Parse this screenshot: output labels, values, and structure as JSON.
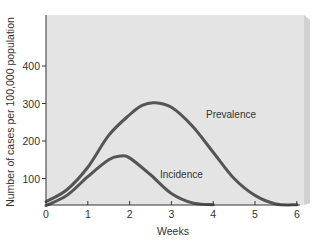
{
  "chart_data": {
    "type": "line",
    "title": "",
    "xlabel": "Weeks",
    "ylabel": "Number of cases per 100,000 population",
    "xlim": [
      0,
      6
    ],
    "ylim": [
      30,
      480
    ],
    "x_ticks": [
      "0",
      "1",
      "2",
      "3",
      "4",
      "5",
      "6"
    ],
    "y_ticks": [
      "100",
      "200",
      "300",
      "400"
    ],
    "grid": false,
    "legend": "inline labels",
    "series": [
      {
        "name": "Prevalence",
        "x": [
          0,
          0.5,
          1,
          1.5,
          2,
          2.3,
          2.6,
          3,
          3.5,
          4,
          4.5,
          5,
          5.5,
          6
        ],
        "values": [
          38,
          70,
          130,
          215,
          270,
          295,
          302,
          290,
          240,
          170,
          100,
          55,
          32,
          30
        ]
      },
      {
        "name": "Incidence",
        "x": [
          0,
          0.5,
          1,
          1.5,
          1.8,
          2,
          2.5,
          3,
          3.5,
          4
        ],
        "values": [
          28,
          55,
          105,
          150,
          160,
          155,
          110,
          60,
          35,
          30
        ]
      }
    ]
  },
  "labels": {
    "xlabel": "Weeks",
    "ylabel": "Number of cases per 100,000 population",
    "prevalence": "Prevalence",
    "incidence": "Incidence",
    "x_ticks": [
      "0",
      "1",
      "2",
      "3",
      "4",
      "5",
      "6"
    ],
    "y_ticks": [
      "100",
      "200",
      "300",
      "400"
    ]
  },
  "colors": {
    "panel": "#e4e4e4",
    "panel_edge": "#cfcfcf",
    "curve": "#555555",
    "axis": "#333333"
  }
}
